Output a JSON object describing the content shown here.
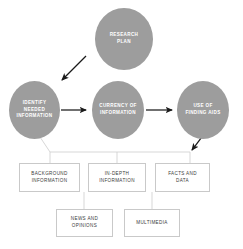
{
  "diagram": {
    "colors": {
      "ellipse_fill": "#9d9d9d",
      "ellipse_text": "#ffffff",
      "box_fill": "#ffffff",
      "box_border": "#c9c9c9",
      "box_text": "#3b3b3b",
      "arrow": "#1a1a1a",
      "connector": "#cdcdcd",
      "background": "#ffffff"
    },
    "nodes": [
      {
        "id": "research-plan",
        "label": "RESEARCH\nPLAN",
        "shape": "ellipse",
        "x": 95,
        "y": 8,
        "width": 58,
        "height": 62
      },
      {
        "id": "identify-needed-information",
        "label": "IDENTIFY\nNEEDED\nINFORMATION",
        "shape": "ellipse",
        "x": 9,
        "y": 81,
        "width": 51,
        "height": 58
      },
      {
        "id": "currency-of-information",
        "label": "CURRENCY OF\nINFORMATION",
        "shape": "ellipse",
        "x": 92,
        "y": 81,
        "width": 52,
        "height": 58
      },
      {
        "id": "use-of-finding-aids",
        "label": "USE OF\nFINDING AIDS",
        "shape": "ellipse",
        "x": 177,
        "y": 81,
        "width": 52,
        "height": 58
      }
    ],
    "leaf_boxes": [
      {
        "id": "background-information",
        "label": "BACKGROUND\nINFORMATION",
        "x": 19,
        "y": 163,
        "width": 61,
        "height": 29
      },
      {
        "id": "in-depth-information",
        "label": "IN-DEPTH\nINFORMATION",
        "x": 88,
        "y": 163,
        "width": 58,
        "height": 29
      },
      {
        "id": "facts-and-data",
        "label": "FACTS AND\nDATA",
        "x": 155,
        "y": 163,
        "width": 55,
        "height": 29
      },
      {
        "id": "news-and-opinions",
        "label": "NEWS AND\nOPINIONS",
        "x": 56,
        "y": 209,
        "width": 57,
        "height": 28
      },
      {
        "id": "multimedia",
        "label": "MULTIMEDIA",
        "x": 124,
        "y": 209,
        "width": 56,
        "height": 28
      }
    ],
    "arrows": [
      {
        "id": "research-plan-to-identify",
        "from": "research-plan",
        "to": "identify-needed-information",
        "style": "solid-arrow",
        "direction": "down-left"
      },
      {
        "id": "identify-to-currency",
        "from": "identify-needed-information",
        "to": "currency-of-information",
        "style": "solid-arrow",
        "direction": "right"
      },
      {
        "id": "currency-to-finding-aids",
        "from": "currency-of-information",
        "to": "use-of-finding-aids",
        "style": "solid-arrow",
        "direction": "right"
      },
      {
        "id": "finding-aids-to-facts",
        "from": "use-of-finding-aids",
        "to": "facts-and-data",
        "style": "solid-arrow",
        "direction": "down-left"
      }
    ],
    "connectors": [
      {
        "id": "identify-to-leaf-bus",
        "from": "identify-needed-information",
        "to": "leaf-box-bus",
        "style": "thin-line"
      },
      {
        "id": "bus-to-background-information",
        "from": "leaf-box-bus",
        "to": "background-information",
        "style": "thin-line"
      },
      {
        "id": "bus-to-in-depth-information",
        "from": "leaf-box-bus",
        "to": "in-depth-information",
        "style": "thin-line"
      },
      {
        "id": "bus-to-facts-and-data",
        "from": "leaf-box-bus",
        "to": "facts-and-data",
        "style": "thin-line"
      },
      {
        "id": "in-depth-to-news-and-opinions",
        "from": "in-depth-information",
        "to": "news-and-opinions",
        "style": "thin-line"
      },
      {
        "id": "bus-to-multimedia",
        "from": "leaf-box-bus",
        "to": "multimedia",
        "style": "thin-line"
      }
    ]
  }
}
